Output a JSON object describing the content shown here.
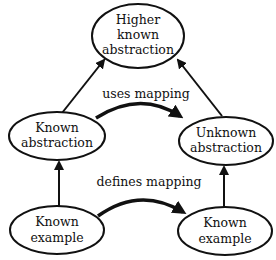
{
  "diagram": {
    "type": "analogy-mapping",
    "nodes": [
      {
        "id": "higher",
        "lines": [
          "Higher",
          "known",
          "abstraction"
        ]
      },
      {
        "id": "known_abstraction",
        "lines": [
          "Known",
          "abstraction"
        ]
      },
      {
        "id": "unknown_abstraction",
        "lines": [
          "Unknown",
          "abstraction"
        ]
      },
      {
        "id": "known_example_left",
        "lines": [
          "Known",
          "example"
        ]
      },
      {
        "id": "known_example_right",
        "lines": [
          "Known",
          "example"
        ]
      }
    ],
    "edges": [
      {
        "from": "known_abstraction",
        "to": "higher",
        "label": ""
      },
      {
        "from": "unknown_abstraction",
        "to": "higher",
        "label": ""
      },
      {
        "from": "known_example_left",
        "to": "known_abstraction",
        "label": ""
      },
      {
        "from": "known_example_right",
        "to": "unknown_abstraction",
        "label": ""
      },
      {
        "from": "known_abstraction",
        "to": "unknown_abstraction",
        "label": "uses mapping"
      },
      {
        "from": "known_example_left",
        "to": "known_example_right",
        "label": "defines mapping"
      }
    ],
    "labels": {
      "uses_mapping": "uses mapping",
      "defines_mapping": "defines mapping"
    },
    "colors": {
      "stroke": "#111111",
      "background": "#ffffff"
    }
  }
}
